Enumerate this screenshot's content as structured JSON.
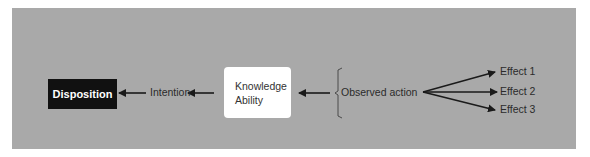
{
  "diagram": {
    "nodes": {
      "disposition": "Disposition",
      "intention": "Intention",
      "knowledge_line1": "Knowledge",
      "knowledge_line2": "Ability",
      "observed_action": "Observed action",
      "effect1": "Effect 1",
      "effect2": "Effect 2",
      "effect3": "Effect 3"
    },
    "edges": [
      {
        "from": "Intention",
        "to": "Disposition"
      },
      {
        "from": "Knowledge/Ability",
        "to": "Intention"
      },
      {
        "from": "Observed action",
        "to": "Knowledge/Ability"
      },
      {
        "from": "Observed action",
        "to": "Effect 1"
      },
      {
        "from": "Observed action",
        "to": "Effect 2"
      },
      {
        "from": "Observed action",
        "to": "Effect 3"
      }
    ],
    "colors": {
      "panel": "#a9a9a9",
      "dark_node": "#111111",
      "light_node": "#ffffff",
      "arrow": "#1a1a1a"
    }
  }
}
